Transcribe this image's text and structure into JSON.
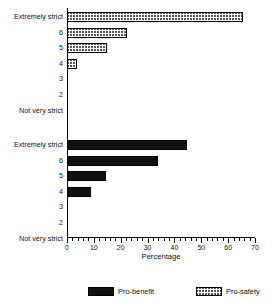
{
  "chart_data": {
    "type": "bar",
    "orientation": "horizontal",
    "title": "",
    "xlabel": "Percentage",
    "ylabel": "",
    "xlim": [
      0,
      70
    ],
    "xticks": [
      0,
      10,
      20,
      30,
      40,
      50,
      60,
      70
    ],
    "xtick_labels": [
      "0",
      "10",
      "20",
      "30",
      "40",
      "50",
      "60",
      "70"
    ],
    "minor_tick_step": 2,
    "grid": false,
    "legend_position": "bottom",
    "categories": [
      "Extremely strict",
      "6",
      "5",
      "4",
      "3",
      "2",
      "Not very strict"
    ],
    "panels": [
      {
        "name": "Pro-safety",
        "fill": "hatched",
        "color": "#555555",
        "values": [
          65.5,
          22.5,
          15.0,
          3.7,
          0,
          0,
          0
        ]
      },
      {
        "name": "Pro-benefit",
        "fill": "solid",
        "color": "#111111",
        "values": [
          44.5,
          34.0,
          14.5,
          9.0,
          0,
          0,
          0
        ]
      }
    ],
    "series": [
      {
        "name": "Pro-benefit",
        "values": [
          44.5,
          34.0,
          14.5,
          9.0,
          0,
          0,
          0
        ]
      },
      {
        "name": "Pro-safety",
        "values": [
          65.5,
          22.5,
          15.0,
          3.7,
          0,
          0,
          0
        ]
      }
    ]
  },
  "legend": {
    "items": [
      {
        "label": "Pro-benefit",
        "swatch": "solid"
      },
      {
        "label": "Pro-safety",
        "swatch": "hatched"
      }
    ]
  },
  "axis": {
    "x_title": "Percentage"
  }
}
